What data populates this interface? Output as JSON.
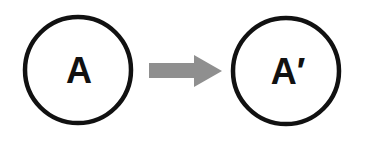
{
  "diagram": {
    "type": "transformation",
    "nodes": [
      {
        "id": "source",
        "label": "A"
      },
      {
        "id": "target",
        "label": "A′"
      }
    ],
    "edges": [
      {
        "from": "source",
        "to": "target",
        "style": "block-arrow"
      }
    ]
  },
  "colors": {
    "background": "#ffffff",
    "node_stroke": "#111111",
    "label": "#111111",
    "arrow_fill": "#8f8f8f"
  }
}
